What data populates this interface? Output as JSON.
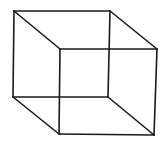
{
  "diagram": {
    "type": "necker-cube-wireframe",
    "stroke_color": "#1a1a1a",
    "background": "#ffffff",
    "vertices": {
      "back_top_left": [
        14,
        11
      ],
      "back_top_right": [
        110,
        11
      ],
      "back_bottom_left": [
        13,
        97
      ],
      "back_bottom_right": [
        108,
        97
      ],
      "front_top_left": [
        60,
        49
      ],
      "front_top_right": [
        157,
        49
      ],
      "front_bottom_left": [
        59,
        134
      ],
      "front_bottom_right": [
        154,
        135
      ]
    }
  }
}
